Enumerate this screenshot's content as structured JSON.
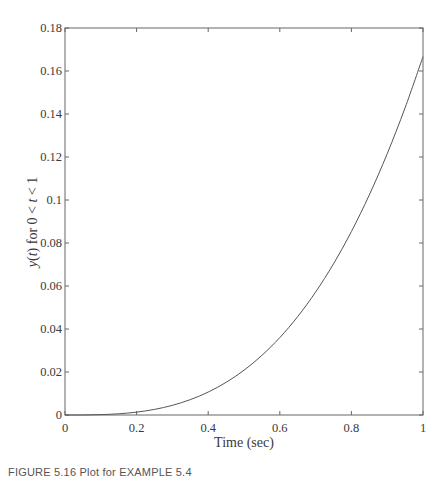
{
  "chart_data": {
    "type": "line",
    "title": "",
    "xlabel": "Time (sec)",
    "ylabel": "y(t) for 0 < t < 1",
    "ylabel_parts": {
      "y": "y",
      "open": "(",
      "t": "t",
      "close": ")",
      "rest1": " for 0 < ",
      "t2": "t",
      "rest2": " < 1"
    },
    "xlim": [
      0,
      1
    ],
    "ylim": [
      0,
      0.18
    ],
    "xticks": [
      0,
      0.2,
      0.4,
      0.6,
      0.8,
      1
    ],
    "xtick_labels": [
      "0",
      "0.2",
      "0.4",
      "0.6",
      "0.8",
      "1"
    ],
    "yticks": [
      0,
      0.02,
      0.04,
      0.06,
      0.08,
      0.1,
      0.12,
      0.14,
      0.16,
      0.18
    ],
    "ytick_labels": [
      "0",
      "0.02",
      "0.04",
      "0.06",
      "0.08",
      "0.1",
      "0.12",
      "0.14",
      "0.16",
      "0.18"
    ],
    "grid": false,
    "box": true,
    "legend": null,
    "series": [
      {
        "name": "y(t)",
        "color": "#555555",
        "x": [
          0,
          0.05,
          0.1,
          0.15,
          0.2,
          0.25,
          0.3,
          0.35,
          0.4,
          0.45,
          0.5,
          0.55,
          0.6,
          0.65,
          0.7,
          0.75,
          0.8,
          0.85,
          0.9,
          0.95,
          1.0
        ],
        "y": [
          0,
          2.08e-05,
          0.000167,
          0.000563,
          0.00133,
          0.0026,
          0.0045,
          0.00715,
          0.01067,
          0.01519,
          0.02083,
          0.02773,
          0.036,
          0.04577,
          0.05717,
          0.07031,
          0.08533,
          0.10235,
          0.1215,
          0.1429,
          0.16667
        ]
      }
    ]
  },
  "caption": "FIGURE 5.16  Plot for EXAMPLE 5.4"
}
